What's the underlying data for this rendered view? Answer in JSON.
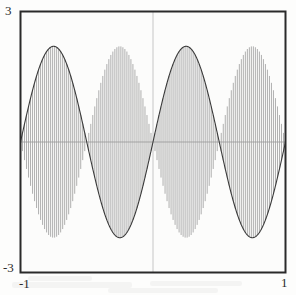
{
  "figure": {
    "kind": "amplitude-modulated-waveform-plot",
    "frame": {
      "x": 20,
      "y": 11,
      "width": 265,
      "height": 261,
      "border_color": "#2a2a2a",
      "background_color": "#fcfcfb"
    },
    "center_line": {
      "present": true,
      "orientation": "vertical",
      "x_value": 0,
      "color": "#c9c9c9"
    },
    "zero_line": {
      "present": true,
      "orientation": "horizontal",
      "y_value": 0,
      "color": "#9a9a9a"
    }
  },
  "axes": {
    "y_max_label": "3",
    "y_min_label": "-3",
    "x_min_label": "-1",
    "x_max_label": "1"
  },
  "colors": {
    "envelope": "#3a3a3a",
    "carrier": "#8e8e8e",
    "frame": "#2a2a2a",
    "paper": "#fdfdfc",
    "center_rule": "#c6c6c6"
  },
  "chart_data": {
    "type": "line",
    "title": "",
    "xlabel": "",
    "ylabel": "",
    "xlim": [
      -1,
      1
    ],
    "ylim": [
      -3,
      3
    ],
    "xticks": [
      -1,
      1
    ],
    "xticklabels": [
      "-1",
      "1"
    ],
    "yticks": [
      -3,
      3
    ],
    "yticklabels": [
      "-3",
      "3"
    ],
    "grid": false,
    "legend": null,
    "series": [
      {
        "name": "envelope",
        "role": "upper-envelope",
        "color": "#3a3a3a",
        "formula": "y = 2.2 * sin(2 * pi * x)",
        "amplitude": 2.2,
        "cycles_over_domain": 2,
        "phase_deg": 0,
        "linewidth": 1.1,
        "peaks_x": [
          -0.75,
          0.25
        ],
        "peaks_y": [
          2.2,
          2.2
        ],
        "troughs_x": [
          -0.25,
          0.75
        ],
        "troughs_y": [
          -2.2,
          -2.2
        ],
        "zeros_x": [
          -1,
          -0.5,
          0,
          0.5,
          1
        ]
      },
      {
        "name": "carrier",
        "role": "modulated-fill",
        "color": "#8e8e8e",
        "formula": "y = 2.2 * sin(2 * pi * x) * cos(2 * pi * 60 * x)",
        "carrier_cycles_over_domain": 120,
        "linewidth": 0.7,
        "fill_style": "dense-vertical-strokes",
        "stroke_count": 132,
        "symmetric_about_zero": true
      }
    ],
    "annotations": []
  },
  "artifacts": {
    "scan_bleed_through": true,
    "note": "faint reversed text visible through the paper near the bottom and upper area"
  }
}
